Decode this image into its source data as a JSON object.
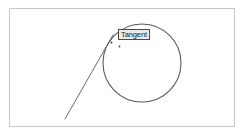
{
  "diagram": {
    "background_color": "#ffffff",
    "frame": {
      "border_color": "#c9c9c9",
      "x": 9,
      "y": 8,
      "width": 226,
      "height": 119
    },
    "annotations": {
      "tangent_label": "Tangent",
      "tangent_label_text_color": "#1a1a1a",
      "tangent_label_fill": "#ebebeb",
      "tangent_label_border": "#4a4a4a"
    },
    "shapes": {
      "circle": {
        "name": "circle",
        "center_x": 142,
        "center_y": 63,
        "radius": 39,
        "stroke": "#5a5a5a",
        "stroke_width": 1.1,
        "fill": "none"
      },
      "tangent_line": {
        "name": "tangent-line",
        "x1": 65,
        "y1": 119,
        "x2": 113,
        "y2": 35,
        "stroke": "#6b6b6b",
        "stroke_width": 1
      },
      "point_markers": [
        {
          "name": "tangent-point-marker",
          "cx": 111.5,
          "cy": 42.5,
          "r": 0.9,
          "fill": "#3a3a3a"
        },
        {
          "name": "secondary-point-marker",
          "cx": 119.5,
          "cy": 46.5,
          "r": 0.9,
          "fill": "#3a3a3a"
        }
      ]
    }
  }
}
